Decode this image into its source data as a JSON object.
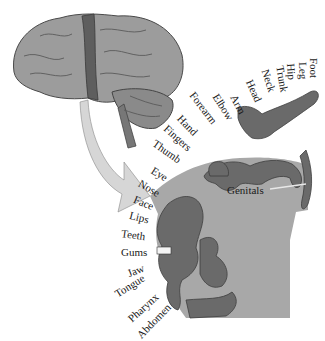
{
  "diagram": {
    "brain": {
      "label": "brain-lateral-view",
      "highlight_strip": "postcentral-gyrus"
    },
    "cortex_labels": [
      {
        "text": "Foot"
      },
      {
        "text": "Leg"
      },
      {
        "text": "Hip"
      },
      {
        "text": "Trunk"
      },
      {
        "text": "Neck"
      },
      {
        "text": "Head"
      },
      {
        "text": "Arm"
      },
      {
        "text": "Elbow"
      },
      {
        "text": "Forearm"
      },
      {
        "text": "Hand"
      },
      {
        "text": "Fingers"
      },
      {
        "text": "Thumb"
      },
      {
        "text": "Eye"
      },
      {
        "text": "Nose"
      },
      {
        "text": "Face"
      },
      {
        "text": "Lips"
      },
      {
        "text": "Teeth"
      },
      {
        "text": "Gums"
      },
      {
        "text": "Jaw"
      },
      {
        "text": "Tongue"
      },
      {
        "text": "Pharynx"
      },
      {
        "text": "Abdomen"
      }
    ],
    "inner_label": "Genitals",
    "colors": {
      "brain": "#9a9a9a",
      "strip": "#5c5c5c",
      "arrow": "#d0d0d0",
      "cortex_section": "#a8a8a8",
      "homunculus": "#6a6a6a"
    }
  }
}
